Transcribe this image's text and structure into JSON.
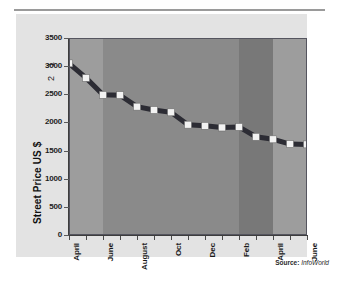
{
  "figure": {
    "source_prefix": "Source:",
    "source_name": "InfoWorld",
    "footnote_refs": [
      "1",
      "2"
    ],
    "panel_color": "#e3e3e3",
    "plot_color": "#8f8f8f"
  },
  "chart_data": {
    "type": "line",
    "title": "",
    "subtitle": "",
    "xlabel": "",
    "ylabel": "Street Price US $",
    "ylim": [
      0,
      3500
    ],
    "ytick_values": [
      0,
      500,
      1000,
      1500,
      2000,
      2500,
      3000,
      3500
    ],
    "ytick_labels": [
      "0",
      "500",
      "1000",
      "1500",
      "2000",
      "2500",
      "3000",
      "3500"
    ],
    "grid": false,
    "legend": false,
    "marker": "square",
    "marker_color": "#f2f2f2",
    "line_color": "#2c2c34",
    "x": [
      "April",
      "May",
      "June",
      "July",
      "August",
      "September",
      "Oct",
      "Nov",
      "Dec",
      "Jan",
      "Feb",
      "March",
      "April",
      "May",
      "June"
    ],
    "xtick_labels": [
      "April",
      "June",
      "August",
      "Oct",
      "Dec",
      "Feb",
      "April",
      "June"
    ],
    "xtick_positions": [
      0,
      2,
      4,
      6,
      8,
      10,
      12,
      14
    ],
    "values": [
      3050,
      2790,
      2490,
      2485,
      2280,
      2220,
      2180,
      1960,
      1940,
      1910,
      1920,
      1745,
      1700,
      1615,
      1610
    ],
    "series": [
      {
        "name": "Street Price US $",
        "values": [
          3050,
          2790,
          2490,
          2485,
          2280,
          2220,
          2180,
          1960,
          1940,
          1910,
          1920,
          1745,
          1700,
          1615,
          1610
        ]
      }
    ],
    "bands": [
      {
        "x_start": 0,
        "x_end": 2,
        "color": "#9d9d9d"
      },
      {
        "x_start": 2,
        "x_end": 10,
        "color": "#8a8a8a"
      },
      {
        "x_start": 10,
        "x_end": 12,
        "color": "#787878"
      },
      {
        "x_start": 12,
        "x_end": 14,
        "color": "#9d9d9d"
      }
    ]
  }
}
